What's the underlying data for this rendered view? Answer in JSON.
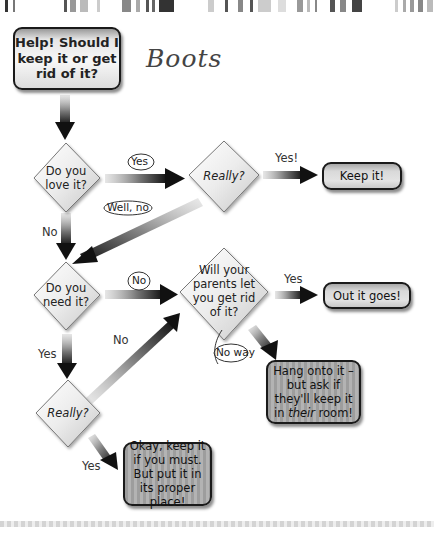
{
  "start": {
    "title": "Help! Should I keep it or get rid of it?"
  },
  "annotation": {
    "item": "Boots"
  },
  "decisions": [
    {
      "id": "love",
      "text": "Do you love it?"
    },
    {
      "id": "really1",
      "text": "Really?"
    },
    {
      "id": "need",
      "text": "Do you need it?"
    },
    {
      "id": "parents",
      "text": "Will your parents let you get rid of it?"
    },
    {
      "id": "really2",
      "text": "Really?"
    }
  ],
  "outcomes": [
    {
      "id": "keep",
      "text": "Keep it!"
    },
    {
      "id": "out",
      "text": "Out it goes!"
    },
    {
      "id": "hang",
      "text_a": "Hang onto it – but ask if they'll keep it in ",
      "text_em": "their",
      "text_b": " room!"
    },
    {
      "id": "okay",
      "text": "Okay, keep it if you must. But put it in its proper place!"
    }
  ],
  "edge_labels": {
    "love_yes": "Yes",
    "really1_yes": "Yes!",
    "really1_no": "Well, no",
    "love_no": "No",
    "need_no": "No",
    "parents_yes": "Yes",
    "parents_no": "No way",
    "need_yes": "Yes",
    "really2_no": "No",
    "really2_yes": "Yes"
  },
  "colors": {
    "outline": "#1a1a1a",
    "arrow_dark": "#111111",
    "arrow_light": "#c8c8c8",
    "background": "#ffffff"
  }
}
